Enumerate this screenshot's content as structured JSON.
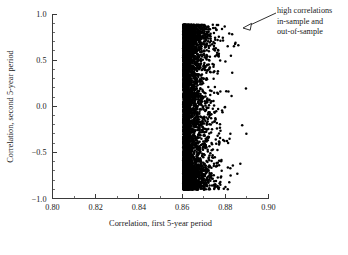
{
  "chart_data": {
    "type": "scatter",
    "title": "",
    "xlabel": "Correlation, first 5-year period",
    "ylabel": "Correlation, second 5-year period",
    "xlim": [
      0.8,
      0.9
    ],
    "ylim": [
      -1.0,
      1.0
    ],
    "grid": false,
    "legend": null,
    "x_ticks": [
      0.8,
      0.82,
      0.84,
      0.86,
      0.88,
      0.9
    ],
    "x_tick_labels": [
      "0.80",
      "0.82",
      "0.84",
      "0.86",
      "0.88",
      "0.90"
    ],
    "x_minor_step": 0.01,
    "y_ticks": [
      -1.0,
      -0.5,
      0.0,
      0.5,
      1.0
    ],
    "y_tick_labels": [
      "-1.0",
      "-0.5",
      "0.0",
      "0.5",
      "1.0"
    ],
    "y_minor_step": 0.1,
    "marker": "filled-circle",
    "marker_color": "#000000",
    "marker_size_px": 1.25,
    "n_points": 4000,
    "data_x_range": [
      0.8605,
      0.8925
    ],
    "data_y_range": [
      -0.905,
      0.885
    ],
    "density_note": "dense vertical band at left edge near x=0.861, thinning rapidly toward higher x",
    "annotations": [
      {
        "name": "high-correlations-callout",
        "lines": [
          "high correlations",
          "in-sample and",
          "out-of-sample"
        ],
        "text_x_px": 277,
        "text_y_px": 13,
        "arrow_from_px": [
          276,
          13
        ],
        "arrow_to_px": [
          243,
          28
        ],
        "arrowhead": "hollow-triangle"
      }
    ]
  },
  "axes": {
    "x_axis_name": "x-axis",
    "y_axis_name": "y-axis"
  }
}
